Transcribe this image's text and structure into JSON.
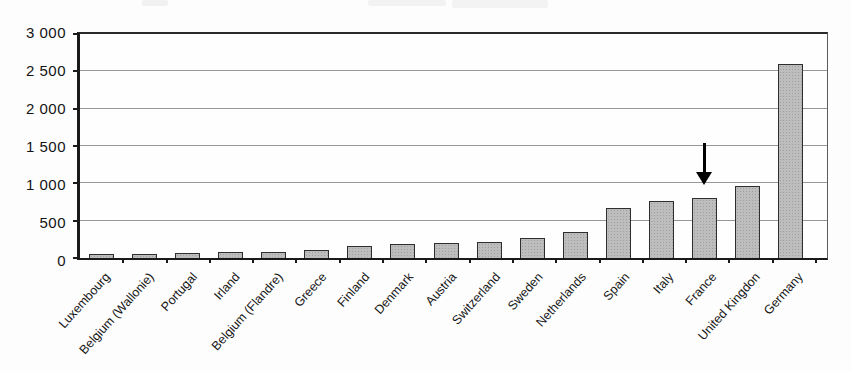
{
  "chart_data": {
    "type": "bar",
    "categories": [
      "Luxembourg",
      "Belgium (Wallonie)",
      "Portugal",
      "Irland",
      "Belgium (Flandre)",
      "Greece",
      "Finland",
      "Denmark",
      "Austria",
      "Switzerland",
      "Sweden",
      "Netherlands",
      "Spain",
      "Italy",
      "France",
      "United Kingdon",
      "Germany"
    ],
    "values": [
      55,
      60,
      70,
      75,
      85,
      105,
      165,
      185,
      200,
      210,
      265,
      345,
      675,
      765,
      810,
      965,
      2600
    ],
    "title": "",
    "xlabel": "",
    "ylabel": "",
    "ylim": [
      0,
      3000
    ],
    "ytick_interval": 500,
    "ytick_labels": [
      "0",
      "500",
      "1 000",
      "1 500",
      "2 000",
      "2 500",
      "3 000"
    ],
    "grid": true,
    "legend": false,
    "annotation": {
      "type": "down-arrow",
      "target_category": "France",
      "target_index": 14
    }
  },
  "colors": {
    "bar_fill": "#bdbdbd",
    "bar_border": "#2e2e2e",
    "gridline": "#979797",
    "axis": "#1a1a1a",
    "text": "#161616",
    "background": "#fdfdfd",
    "arrow": "#000000"
  }
}
